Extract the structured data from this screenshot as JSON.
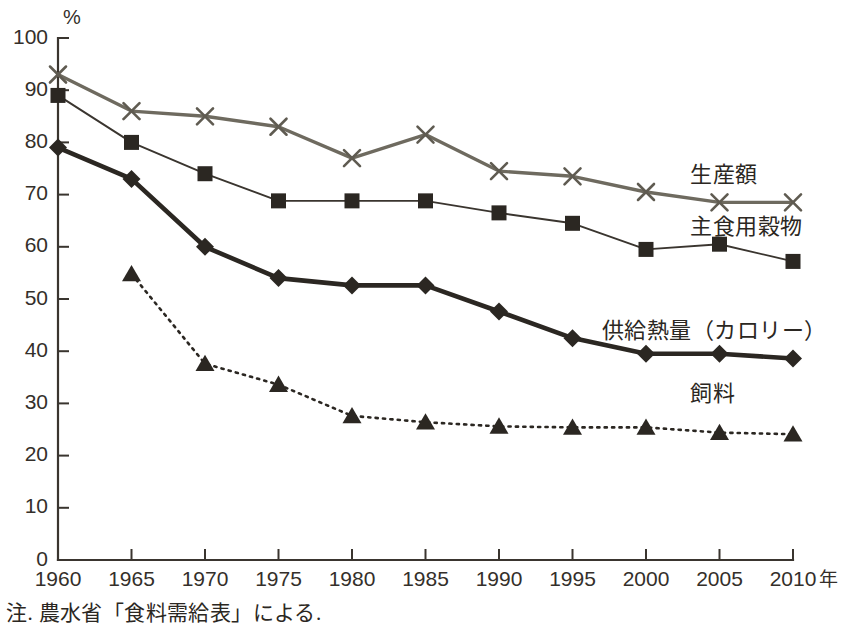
{
  "chart_data": {
    "type": "line",
    "title": "",
    "xlabel": "年",
    "ylabel": "%",
    "unit_label": "%",
    "xlim": [
      1960,
      2010
    ],
    "ylim": [
      0,
      100
    ],
    "grid": false,
    "legend_position": "inline-right",
    "x": [
      1960,
      1965,
      1970,
      1975,
      1980,
      1985,
      1990,
      1995,
      2000,
      2005,
      2010
    ],
    "xtick_labels": [
      "1960",
      "1965",
      "1970",
      "1975",
      "1980",
      "1985",
      "1990",
      "1995",
      "2000",
      "2005",
      "2010"
    ],
    "ytick_labels": [
      "0",
      "10",
      "20",
      "30",
      "40",
      "50",
      "60",
      "70",
      "80",
      "90",
      "100"
    ],
    "yticks": [
      0,
      10,
      20,
      30,
      40,
      50,
      60,
      70,
      80,
      90,
      100
    ],
    "series": [
      {
        "name": "生産額",
        "marker": "x",
        "linestyle": "solid",
        "color": "#6e6a5f",
        "x": [
          1960,
          1965,
          1970,
          1975,
          1980,
          1985,
          1990,
          1995,
          2000,
          2005,
          2010
        ],
        "values": [
          93,
          86,
          85,
          83,
          77,
          81.5,
          74.5,
          73.5,
          70.5,
          68.5,
          68.5
        ]
      },
      {
        "name": "主食用穀物",
        "marker": "square",
        "linestyle": "solid",
        "color": "#3a352f",
        "x": [
          1960,
          1965,
          1970,
          1975,
          1980,
          1985,
          1990,
          1995,
          2000,
          2005,
          2010
        ],
        "values": [
          89,
          80,
          74,
          68.8,
          68.8,
          68.8,
          66.5,
          64.5,
          59.5,
          60.5,
          57.2
        ]
      },
      {
        "name": "供給熱量（カロリー）",
        "marker": "diamond",
        "linestyle": "solid",
        "color": "#2b2722",
        "x": [
          1960,
          1965,
          1970,
          1975,
          1980,
          1985,
          1990,
          1995,
          2000,
          2005,
          2010
        ],
        "values": [
          79,
          73,
          60,
          54,
          52.6,
          52.6,
          47.6,
          42.5,
          39.5,
          39.5,
          38.6
        ]
      },
      {
        "name": "飼料",
        "marker": "triangle",
        "linestyle": "dotted",
        "color": "#2b2722",
        "x": [
          1965,
          1970,
          1975,
          1980,
          1985,
          1990,
          1995,
          2000,
          2005,
          2010
        ],
        "values": [
          54.8,
          37.6,
          33.6,
          27.6,
          26.4,
          25.6,
          25.4,
          25.4,
          24.4,
          24.1
        ]
      }
    ],
    "annotations": [
      {
        "text": "生産額",
        "x": 2003,
        "y": 72.5
      },
      {
        "text": "主食用穀物",
        "x": 2003,
        "y": 62.5
      },
      {
        "text": "供給熱量（カロリー）",
        "x": 1997,
        "y": 42.5
      },
      {
        "text": "飼料",
        "x": 2003,
        "y": 30.5
      }
    ]
  },
  "footnote": {
    "text": "注. 農水省「食料需給表」による."
  }
}
